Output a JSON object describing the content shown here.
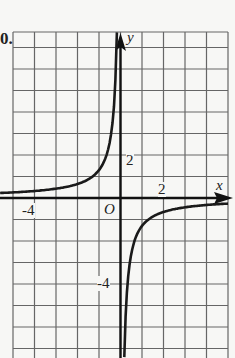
{
  "problem_number": "0.",
  "chart_data": {
    "type": "line",
    "title": "",
    "xlabel": "x",
    "ylabel": "y",
    "origin_label": "O",
    "tick_labels": {
      "x": [
        "-4",
        "2"
      ],
      "y": [
        "2",
        "-4"
      ]
    },
    "xlim": [
      -5,
      5
    ],
    "ylim": [
      -7.5,
      8
    ],
    "grid": true,
    "series": [
      {
        "name": "left branch (x<0)",
        "x": [
          -5,
          -4,
          -3,
          -2,
          -1.5,
          -1,
          -0.5,
          -0.25,
          -0.17
        ],
        "y": [
          0.26,
          0.33,
          0.43,
          0.65,
          0.87,
          1.3,
          2.6,
          5.2,
          7.8
        ]
      },
      {
        "name": "right branch (x>0)",
        "x": [
          0.17,
          0.25,
          0.5,
          1,
          1.5,
          2,
          3,
          4,
          5
        ],
        "y": [
          -7.8,
          -5.2,
          -2.6,
          -1.3,
          -0.87,
          -0.65,
          -0.43,
          -0.33,
          -0.26
        ]
      }
    ],
    "approx_function": "y = -1.3/x"
  }
}
